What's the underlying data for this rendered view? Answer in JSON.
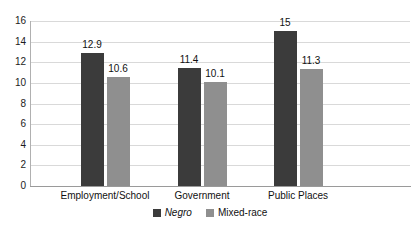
{
  "chart_data": {
    "type": "bar",
    "title": "",
    "subtitle": "",
    "xlabel": "",
    "ylabel": "",
    "categories": [
      "Employment/School",
      "Government",
      "Public Places"
    ],
    "series": [
      {
        "name": "Negro",
        "color": "#3b3b3b",
        "values": [
          12.9,
          11.4,
          15
        ],
        "labels": [
          "12.9",
          "11.4",
          "15"
        ]
      },
      {
        "name": "Mixed-race",
        "color": "#8f8f8f",
        "values": [
          10.6,
          10.1,
          11.3
        ],
        "labels": [
          "10.6",
          "10.1",
          "11.3"
        ]
      }
    ],
    "ylim": [
      0,
      16
    ],
    "ytick_step": 2,
    "yticks": [
      16,
      14,
      12,
      10,
      8,
      6,
      4,
      2,
      0
    ],
    "ytick_labels": [
      "16",
      "14",
      "12",
      "10",
      "8",
      "6",
      "4",
      "2",
      "0"
    ],
    "grid": true,
    "grid_color": "#d9d9d9",
    "legend_position": "bottom",
    "background": "#ffffff"
  },
  "legend": {
    "items": [
      {
        "label": "Negro",
        "style": "italic"
      },
      {
        "label": "Mixed-race",
        "style": "normal"
      }
    ]
  }
}
